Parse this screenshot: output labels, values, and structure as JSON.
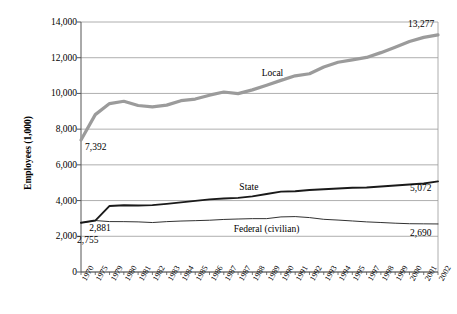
{
  "chart_data": {
    "type": "line",
    "title": "",
    "xlabel": "",
    "ylabel": "Employees (1,000)",
    "ylim": [
      0,
      14000
    ],
    "ytick_labels": [
      "14,000",
      "12,000",
      "10,000",
      "8,000",
      "6,000",
      "4,000",
      "2,000",
      "0"
    ],
    "ytick_values": [
      14000,
      12000,
      10000,
      8000,
      6000,
      4000,
      2000,
      0
    ],
    "grid": true,
    "grid_axis": "y",
    "legend": "inline-series-labels",
    "categories": [
      "1970",
      "1975",
      "1979",
      "1980",
      "1981",
      "1982",
      "1983",
      "1984",
      "1985",
      "1986",
      "1987",
      "1987",
      "1988",
      "1989",
      "1990",
      "1991",
      "1992",
      "1993",
      "1994",
      "1995",
      "1997",
      "1998",
      "1999",
      "2000",
      "2001",
      "2002"
    ],
    "series": [
      {
        "name": "Local",
        "color": "#9b9b9b",
        "width": 3.2,
        "values": [
          7392,
          8813,
          9432,
          9562,
          9324,
          9246,
          9344,
          9595,
          9686,
          9902,
          10079,
          9990,
          10200,
          10462,
          10731,
          10987,
          11103,
          11482,
          11747,
          11880,
          12016,
          12284,
          12586,
          12903,
          13139,
          13277
        ]
      },
      {
        "name": "State",
        "color": "#1a1a1a",
        "width": 1.9,
        "values": [
          2755,
          2881,
          3699,
          3739,
          3726,
          3744,
          3816,
          3898,
          3984,
          4068,
          4115,
          4153,
          4236,
          4365,
          4503,
          4521,
          4595,
          4635,
          4675,
          4719,
          4733,
          4784,
          4848,
          4899,
          4959,
          5072
        ]
      },
      {
        "name": "Federal (civilian)",
        "color": "#1a1a1a",
        "width": 0.9,
        "values": [
          2755,
          2881,
          2823,
          2821,
          2806,
          2770,
          2820,
          2854,
          2875,
          2899,
          2943,
          2968,
          2988,
          2988,
          3085,
          3103,
          3047,
          2950,
          2908,
          2858,
          2806,
          2772,
          2733,
          2704,
          2697,
          2690
        ]
      }
    ],
    "point_labels": [
      {
        "text": "7,392",
        "series": "Local",
        "category": "1970"
      },
      {
        "text": "13,277",
        "series": "Local",
        "category": "2002"
      },
      {
        "text": "2,881",
        "series": "State",
        "category": "1975"
      },
      {
        "text": "5,072",
        "series": "State",
        "category": "2002"
      },
      {
        "text": "2,755",
        "series": "Federal (civilian)",
        "category": "1970"
      },
      {
        "text": "2,690",
        "series": "Federal (civilian)",
        "category": "2002"
      }
    ]
  },
  "axis": {
    "y_title": "Employees (1,000)"
  },
  "colors": {
    "local": "#9b9b9b",
    "state": "#1a1a1a",
    "federal": "#1a1a1a",
    "grid": "#9a9a9a",
    "axis": "#555555",
    "background": "#ffffff"
  }
}
